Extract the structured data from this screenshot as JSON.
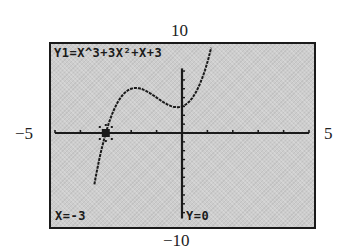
{
  "window": {
    "xmin": -5,
    "xmax": 5,
    "ymin": -10,
    "ymax": 10,
    "labels": {
      "xmin": "−5",
      "xmax": "5",
      "ymin": "−10",
      "ymax": "10"
    }
  },
  "screen": {
    "equation_label": "Y1=X^3+3X²+X+3",
    "trace_x_label": "X=-3",
    "trace_y_label": "Y=0",
    "background_color": "#cdcdcd",
    "ink_color": "#1a1a1a"
  },
  "chart_data": {
    "type": "line",
    "title": "Y1=X^3+3X²+X+3",
    "xlabel": "",
    "ylabel": "",
    "xlim": [
      -5,
      5
    ],
    "ylim": [
      -10,
      10
    ],
    "x_tick_step": 1,
    "y_tick_step": 1,
    "grid": false,
    "legend": "none",
    "series": [
      {
        "name": "Y1",
        "expression": "x^3+3x^2+x+3",
        "x": [
          -3.45,
          -3.25,
          -3.0,
          -2.75,
          -2.5,
          -2.25,
          -2.0,
          -1.8165,
          -1.5,
          -1.25,
          -1.0,
          -0.75,
          -0.5,
          -0.1835,
          0.0,
          0.25,
          0.5,
          0.75,
          1.0,
          1.2
        ],
        "y": [
          -10.0,
          -3.83,
          0.0,
          2.55,
          4.13,
          4.92,
          5.0,
          5.09,
          4.88,
          4.48,
          4.0,
          3.52,
          3.13,
          2.91,
          3.0,
          3.45,
          4.38,
          5.86,
          8.0,
          10.05
        ]
      }
    ],
    "annotations": [
      {
        "type": "trace-cursor",
        "x": -3,
        "y": 0,
        "text": "X=-3  Y=0"
      },
      {
        "type": "local-max",
        "x": -1.8165,
        "y": 5.09
      },
      {
        "type": "y-intercept",
        "x": 0,
        "y": 3
      }
    ]
  }
}
